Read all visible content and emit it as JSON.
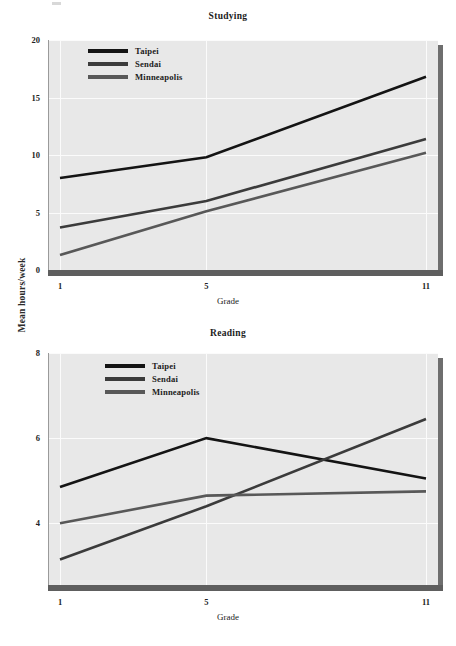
{
  "figure": {
    "shared_ylabel": "Mean hours/week",
    "background_color": "#ffffff",
    "panel_color": "#e8e8e8",
    "grid_color": "#fbfbfb",
    "shadow_color": "#6e6e6e"
  },
  "series_colors": {
    "Taipei": "#141414",
    "Sendai": "#3b3b3b",
    "Minneapolis": "#585858"
  },
  "charts": [
    {
      "key": "studying",
      "title": "Studying",
      "xlabel": "Grade",
      "xticks": [
        "1",
        "5",
        "11"
      ],
      "yticks": [
        "0",
        "5",
        "10",
        "15",
        "20"
      ],
      "legend": [
        "Taipei",
        "Sendai",
        "Minneapolis"
      ]
    },
    {
      "key": "reading",
      "title": "Reading",
      "xlabel": "Grade",
      "xticks": [
        "1",
        "5",
        "11"
      ],
      "yticks": [
        "4",
        "6",
        "8"
      ],
      "legend": [
        "Taipei",
        "Sendai",
        "Minneapolis"
      ]
    }
  ],
  "chart_data": [
    {
      "type": "line",
      "title": "Studying",
      "xlabel": "Grade",
      "ylabel": "Mean hours/week",
      "categories": [
        1,
        5,
        11
      ],
      "x_tick_labels": [
        "1",
        "5",
        "11"
      ],
      "y_tick_values": [
        0,
        5,
        10,
        15,
        20
      ],
      "y_tick_labels": [
        "0",
        "5",
        "10",
        "15",
        "20"
      ],
      "xlim": [
        1,
        11
      ],
      "ylim": [
        0,
        20
      ],
      "grid": true,
      "legend_position": "upper left",
      "series": [
        {
          "name": "Taipei",
          "values": [
            8.0,
            9.8,
            16.8
          ],
          "color": "#141414"
        },
        {
          "name": "Sendai",
          "values": [
            3.7,
            6.0,
            11.4
          ],
          "color": "#3b3b3b"
        },
        {
          "name": "Minneapolis",
          "values": [
            1.3,
            5.1,
            10.2
          ],
          "color": "#585858"
        }
      ]
    },
    {
      "type": "line",
      "title": "Reading",
      "xlabel": "Grade",
      "ylabel": "Mean hours/week",
      "categories": [
        1,
        5,
        11
      ],
      "x_tick_labels": [
        "1",
        "5",
        "11"
      ],
      "y_tick_values": [
        4,
        6,
        8
      ],
      "y_tick_labels": [
        "4",
        "6",
        "8"
      ],
      "xlim": [
        1,
        11
      ],
      "ylim": [
        2.55,
        8.0
      ],
      "grid": true,
      "legend_position": "upper left",
      "series": [
        {
          "name": "Taipei",
          "values": [
            4.85,
            6.0,
            5.05
          ],
          "color": "#141414"
        },
        {
          "name": "Sendai",
          "values": [
            3.15,
            4.4,
            6.45
          ],
          "color": "#3b3b3b"
        },
        {
          "name": "Minneapolis",
          "values": [
            4.0,
            4.65,
            4.75
          ],
          "color": "#585858"
        }
      ]
    }
  ]
}
